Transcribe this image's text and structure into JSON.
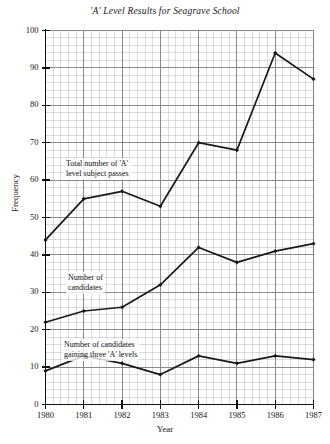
{
  "chart_data": {
    "type": "line",
    "title": "'A' Level Results for Seagrave School",
    "xlabel": "Year",
    "ylabel": "Frequency",
    "categories": [
      "1980",
      "1981",
      "1982",
      "1983",
      "1984",
      "1985",
      "1986",
      "1987"
    ],
    "x": [
      1980,
      1981,
      1982,
      1983,
      1984,
      1985,
      1986,
      1987
    ],
    "xlim": [
      1980,
      1987
    ],
    "ylim": [
      0,
      100
    ],
    "y_ticks": [
      0,
      10,
      20,
      30,
      40,
      50,
      60,
      70,
      80,
      90,
      100
    ],
    "x_ticks": [
      "1980",
      "1981",
      "1982",
      "1983",
      "1984",
      "1985",
      "1986",
      "1987"
    ],
    "grid": "major and minor graph-paper grid",
    "legend": "none (series labelled inline with annotations)",
    "marker": "small filled diamond at each data point",
    "series": [
      {
        "name": "Total number of 'A' level subject passes",
        "values": [
          44,
          55,
          57,
          53,
          70,
          68,
          94,
          87
        ]
      },
      {
        "name": "Number of candidates",
        "values": [
          22,
          25,
          26,
          32,
          42,
          38,
          41,
          43
        ]
      },
      {
        "name": "Number of candidates gaining three 'A' levels",
        "values": [
          9,
          13,
          11,
          8,
          13,
          11,
          13,
          12
        ]
      }
    ],
    "annotations": [
      {
        "text": "Total number of 'A'\nlevel subject passes",
        "series": 0
      },
      {
        "text": "Number of\ncandidates",
        "series": 1
      },
      {
        "text": "Number of candidates\ngaining three 'A' levels",
        "series": 2
      }
    ],
    "colors": {
      "line": "#1a1a1a",
      "grid_minor": "#b9b9b9",
      "grid_major": "#7d7d7d",
      "axis": "#111111",
      "background": "#ffffff"
    }
  }
}
